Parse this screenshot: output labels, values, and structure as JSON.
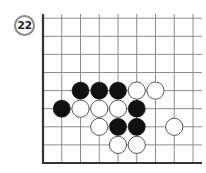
{
  "problem": {
    "number": "22"
  },
  "board": {
    "columns": 9,
    "rows": 9,
    "origin_x": 43,
    "origin_y": 163,
    "spacing_x": 18.75,
    "spacing_y": 18.1,
    "top_y": 14,
    "right_x": 202,
    "stone_radius": 8.6,
    "colors": {
      "line": "#8c8c8c",
      "edge": "#333333",
      "black": "#111111",
      "white": "#ffffff",
      "white_outline": "#444444"
    },
    "stones": [
      {
        "color": "black",
        "col": 2,
        "row": 4
      },
      {
        "color": "black",
        "col": 3,
        "row": 4
      },
      {
        "color": "black",
        "col": 4,
        "row": 4
      },
      {
        "color": "white",
        "col": 5,
        "row": 4
      },
      {
        "color": "white",
        "col": 6,
        "row": 4
      },
      {
        "color": "black",
        "col": 1,
        "row": 3
      },
      {
        "color": "white",
        "col": 2,
        "row": 3
      },
      {
        "color": "white",
        "col": 3,
        "row": 3
      },
      {
        "color": "white",
        "col": 4,
        "row": 3
      },
      {
        "color": "black",
        "col": 5,
        "row": 3
      },
      {
        "color": "white",
        "col": 3,
        "row": 2
      },
      {
        "color": "black",
        "col": 4,
        "row": 2
      },
      {
        "color": "black",
        "col": 5,
        "row": 2
      },
      {
        "color": "white",
        "col": 7,
        "row": 2
      },
      {
        "color": "white",
        "col": 4,
        "row": 1
      },
      {
        "color": "white",
        "col": 5,
        "row": 1
      }
    ]
  }
}
